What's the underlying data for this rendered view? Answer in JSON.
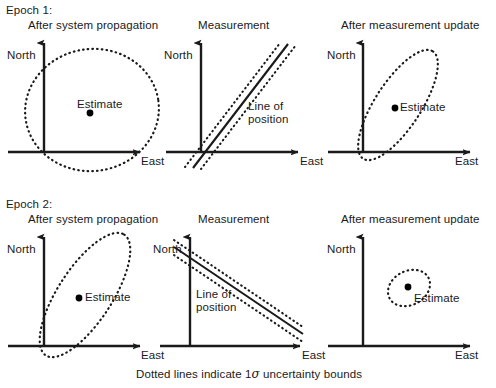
{
  "figure": {
    "caption": "Dotted lines indicate 1",
    "caption_sigma": "σ",
    "caption_tail": " uncertainty bounds",
    "stroke_color": "#1a1a1a",
    "background": "#ffffff"
  },
  "epochs": [
    {
      "label": "Epoch 1:",
      "panels": [
        {
          "title": "After system propagation",
          "y_axis_label": "North",
          "x_axis_label": "East",
          "annotation": "Estimate",
          "shape": "large-circular-ellipse"
        },
        {
          "title": "Measurement",
          "y_axis_label": "North",
          "x_axis_label": "East",
          "annotation_line1": "Line of",
          "annotation_line2": "position",
          "shape": "positive-slope-lop"
        },
        {
          "title": "After measurement update",
          "y_axis_label": "North",
          "x_axis_label": "East",
          "annotation": "Estimate",
          "shape": "narrow-tilted-ellipse"
        }
      ]
    },
    {
      "label": "Epoch 2:",
      "panels": [
        {
          "title": "After system propagation",
          "y_axis_label": "North",
          "x_axis_label": "East",
          "annotation": "Estimate",
          "shape": "narrow-tilted-ellipse-large"
        },
        {
          "title": "Measurement",
          "y_axis_label": "North",
          "x_axis_label": "East",
          "annotation_line1": "Line of",
          "annotation_line2": "position",
          "shape": "negative-slope-lop"
        },
        {
          "title": "After measurement update",
          "y_axis_label": "North",
          "x_axis_label": "East",
          "annotation": "Estimate",
          "shape": "small-ellipse"
        }
      ]
    }
  ]
}
